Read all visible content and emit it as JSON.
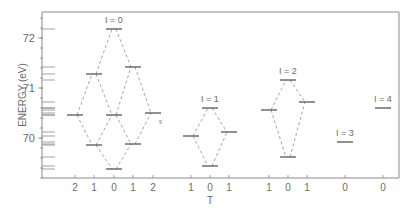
{
  "chart_data": {
    "type": "level-diagram",
    "title": "",
    "ylabel": "ENERGY (eV)",
    "xlabel": "T",
    "ylim": [
      69.2,
      72.52
    ],
    "y_ticks": [
      70,
      71,
      72
    ],
    "y_tick_labels": [
      "70",
      "71",
      "72"
    ],
    "y_minor_step": 0.2,
    "groups": [
      {
        "label": "I = 0",
        "levels": [
          {
            "T": 2,
            "slot": 0,
            "E": 70.46
          },
          {
            "T": 1,
            "slot": 1,
            "E": 71.28
          },
          {
            "T": 1,
            "slot": 1,
            "E": 69.86
          },
          {
            "T": 0,
            "slot": 2,
            "E": 72.18
          },
          {
            "T": 0,
            "slot": 2,
            "E": 70.46
          },
          {
            "T": 0,
            "slot": 2,
            "E": 69.38
          },
          {
            "T": 1,
            "slot": 3,
            "E": 71.42
          },
          {
            "T": 1,
            "slot": 3,
            "E": 69.88
          },
          {
            "T": 2,
            "slot": 4,
            "E": 70.5
          }
        ],
        "connections": [
          [
            0,
            1
          ],
          [
            1,
            3
          ],
          [
            3,
            6
          ],
          [
            6,
            8
          ],
          [
            0,
            2
          ],
          [
            2,
            5
          ],
          [
            5,
            7
          ],
          [
            7,
            8
          ],
          [
            1,
            4
          ],
          [
            4,
            7
          ],
          [
            2,
            4
          ],
          [
            4,
            6
          ]
        ]
      },
      {
        "label": "I = 1",
        "levels": [
          {
            "T": 1,
            "slot": 0,
            "E": 70.04
          },
          {
            "T": 0,
            "slot": 1,
            "E": 70.6
          },
          {
            "T": 0,
            "slot": 1,
            "E": 69.44
          },
          {
            "T": 1,
            "slot": 2,
            "E": 70.12
          }
        ],
        "connections": [
          [
            0,
            1
          ],
          [
            1,
            3
          ],
          [
            0,
            2
          ],
          [
            2,
            3
          ]
        ]
      },
      {
        "label": "I = 2",
        "levels": [
          {
            "T": 1,
            "slot": 0,
            "E": 70.56
          },
          {
            "T": 0,
            "slot": 1,
            "E": 71.16
          },
          {
            "T": 0,
            "slot": 1,
            "E": 69.62
          },
          {
            "T": 1,
            "slot": 2,
            "E": 70.72
          }
        ],
        "connections": [
          [
            0,
            1
          ],
          [
            1,
            3
          ],
          [
            0,
            2
          ],
          [
            2,
            3
          ]
        ]
      },
      {
        "label": "I = 3",
        "levels": [
          {
            "T": 0,
            "slot": 0,
            "E": 69.92
          }
        ],
        "connections": []
      },
      {
        "label": "I = 4",
        "levels": [
          {
            "T": 0,
            "slot": 0,
            "E": 70.6
          }
        ],
        "connections": []
      }
    ],
    "x_tick_labels": [
      "2",
      "1",
      "0",
      "1",
      "2",
      "1",
      "0",
      "1",
      "1",
      "0",
      "1",
      "0",
      "0"
    ],
    "grid": false,
    "legend": null
  },
  "layout_hints": {
    "frame": {
      "left": 42,
      "top": 12,
      "right": 399,
      "bottom": 178
    },
    "energy_ref": {
      "E": 72,
      "y": 38,
      "px_per_eV": 50
    },
    "group_slot_x": [
      [
        75,
        94,
        114,
        133,
        153
      ],
      [
        191,
        210,
        229
      ],
      [
        269,
        288,
        307
      ],
      [
        345
      ],
      [
        383
      ]
    ],
    "level_half_width": 8
  }
}
